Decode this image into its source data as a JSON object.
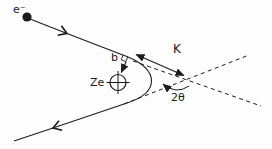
{
  "diagram": {
    "labels": {
      "electron": "e⁻",
      "impact_parameter": "b",
      "nucleus": "Ze",
      "momentum_transfer": "K",
      "scattering_angle": "2θ"
    },
    "colors": {
      "stroke": "#1c1c1c",
      "background": "#fdfdfd"
    }
  }
}
